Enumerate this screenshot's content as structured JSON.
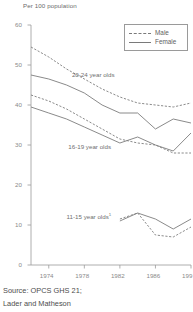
{
  "chart_data": {
    "type": "line",
    "title": "",
    "ylabel": "Per 100 population",
    "xlabel": "",
    "ylim": [
      0,
      60
    ],
    "xlim": [
      1972,
      1990
    ],
    "grid": false,
    "legend_position": "top-right",
    "x": [
      1972,
      1974,
      1976,
      1978,
      1980,
      1982,
      1984,
      1986,
      1988,
      1990
    ],
    "xticks": [
      1974,
      1978,
      1982,
      1986,
      1990
    ],
    "xtick_labels": [
      "1974",
      "1978",
      "1982",
      "1986",
      "199"
    ],
    "yticks": [
      0,
      10,
      20,
      30,
      40,
      50,
      60
    ],
    "ytick_labels": [
      "0",
      "10",
      "20",
      "30",
      "40",
      "50",
      "60"
    ],
    "legend": [
      {
        "name": "Male",
        "style": "dashed"
      },
      {
        "name": "Female",
        "style": "solid"
      }
    ],
    "annotations": [
      {
        "text": "20-24 year olds",
        "x": 1976.6,
        "y": 47.5
      },
      {
        "text": "16-19 year olds",
        "x": 1976.2,
        "y": 29.5
      },
      {
        "text": "11-15 year olds",
        "sup": "1",
        "x": 1976.0,
        "y": 12.2
      }
    ],
    "series": [
      {
        "name": "20-24 year olds Male",
        "style": "dashed",
        "values": [
          54.5,
          52.0,
          49.0,
          46.5,
          44.0,
          42.0,
          40.5,
          40.0,
          39.5,
          40.5
        ]
      },
      {
        "name": "20-24 year olds Female",
        "style": "solid",
        "values": [
          47.5,
          46.5,
          45.0,
          43.0,
          40.0,
          38.0,
          38.0,
          34.0,
          36.5,
          35.5
        ]
      },
      {
        "name": "16-19 year olds Male",
        "style": "dashed",
        "values": [
          42.5,
          41.0,
          39.0,
          36.5,
          34.0,
          31.5,
          30.5,
          30.0,
          28.0,
          28.0
        ]
      },
      {
        "name": "16-19 year olds Female",
        "style": "solid",
        "values": [
          39.5,
          38.0,
          36.5,
          34.5,
          32.5,
          30.5,
          32.0,
          30.0,
          28.5,
          33.0
        ]
      },
      {
        "name": "11-15 year olds Male",
        "style": "dashed",
        "values": [
          null,
          null,
          null,
          null,
          null,
          11.5,
          13.0,
          7.5,
          7.0,
          9.5
        ]
      },
      {
        "name": "11-15 year olds Female",
        "style": "solid",
        "values": [
          null,
          null,
          null,
          null,
          null,
          11.0,
          13.0,
          11.5,
          9.0,
          11.5
        ]
      }
    ]
  },
  "source": {
    "line1": "Source: OPCS GHS 21;",
    "line2": "Lader and Matheson"
  }
}
